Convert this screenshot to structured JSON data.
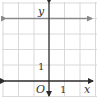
{
  "graph": {
    "x_axis_label": "x",
    "y_axis_label": "y",
    "origin_label": "O",
    "x_tick_label": "1",
    "y_tick_label": "1",
    "grid": {
      "x_range": [
        -3,
        3
      ],
      "y_range": [
        -1,
        5
      ],
      "unit": 1
    },
    "line": {
      "equation": "y = 4",
      "y_value": 4,
      "color": "#8a8a8a",
      "arrows": "both"
    },
    "colors": {
      "grid": "#d9d9d9",
      "axes": "#2b2b2b",
      "line": "#8a8a8a"
    }
  }
}
